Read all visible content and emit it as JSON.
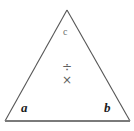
{
  "figure": {
    "type": "geometry-diagram",
    "shape": "triangle",
    "background_color": "#ffffff",
    "stroke_color": "#555555",
    "base_stroke_color": "#7a7a7a",
    "vertices": [
      {
        "name": "apex",
        "x": 67,
        "y": 10
      },
      {
        "name": "bottom-left",
        "x": 5,
        "y": 121
      },
      {
        "name": "bottom-right",
        "x": 130,
        "y": 121
      }
    ],
    "labels": {
      "bottom_left": "a",
      "bottom_right": "b",
      "upper_center": "c"
    },
    "label_colors": {
      "vertex": "#1c1c1c",
      "side": "#6e6e6e",
      "operator": "#5f5f5f"
    },
    "operators": {
      "divide": "÷",
      "multiply": "×"
    },
    "icon_names": {
      "divide": "division-sign-icon",
      "multiply": "multiplication-sign-icon",
      "shape": "triangle-outline-icon"
    }
  }
}
